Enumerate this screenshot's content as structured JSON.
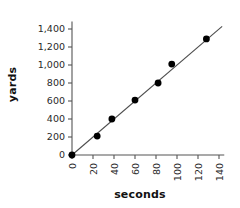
{
  "chart_data": {
    "type": "scatter",
    "title": "",
    "xlabel": "seconds",
    "ylabel": "yards",
    "xlim": [
      0,
      145
    ],
    "ylim": [
      0,
      1450
    ],
    "grid": false,
    "legend": "none",
    "x_ticks": [
      "0",
      "20",
      "40",
      "60",
      "80",
      "100",
      "120",
      "140"
    ],
    "x_tick_values": [
      0,
      20,
      40,
      60,
      80,
      100,
      120,
      140
    ],
    "x_tick_rotation": -90,
    "y_ticks": [
      "0",
      "200",
      "400",
      "600",
      "800",
      "1,000",
      "1,200",
      "1,400"
    ],
    "y_tick_values": [
      0,
      200,
      400,
      600,
      800,
      1000,
      1200,
      1400
    ],
    "points": [
      {
        "x": 0,
        "y": 0
      },
      {
        "x": 24,
        "y": 210
      },
      {
        "x": 38,
        "y": 400
      },
      {
        "x": 60,
        "y": 610
      },
      {
        "x": 82,
        "y": 800
      },
      {
        "x": 95,
        "y": 1010
      },
      {
        "x": 128,
        "y": 1290
      }
    ],
    "trendline": {
      "x0": 0,
      "y0": 0,
      "x1": 143,
      "y1": 1430,
      "slope": 10,
      "intercept": 0
    },
    "marker_color": "#000000",
    "line_color": "#4d4d4d",
    "axis_color": "#555555",
    "background_color": "#ffffff"
  }
}
